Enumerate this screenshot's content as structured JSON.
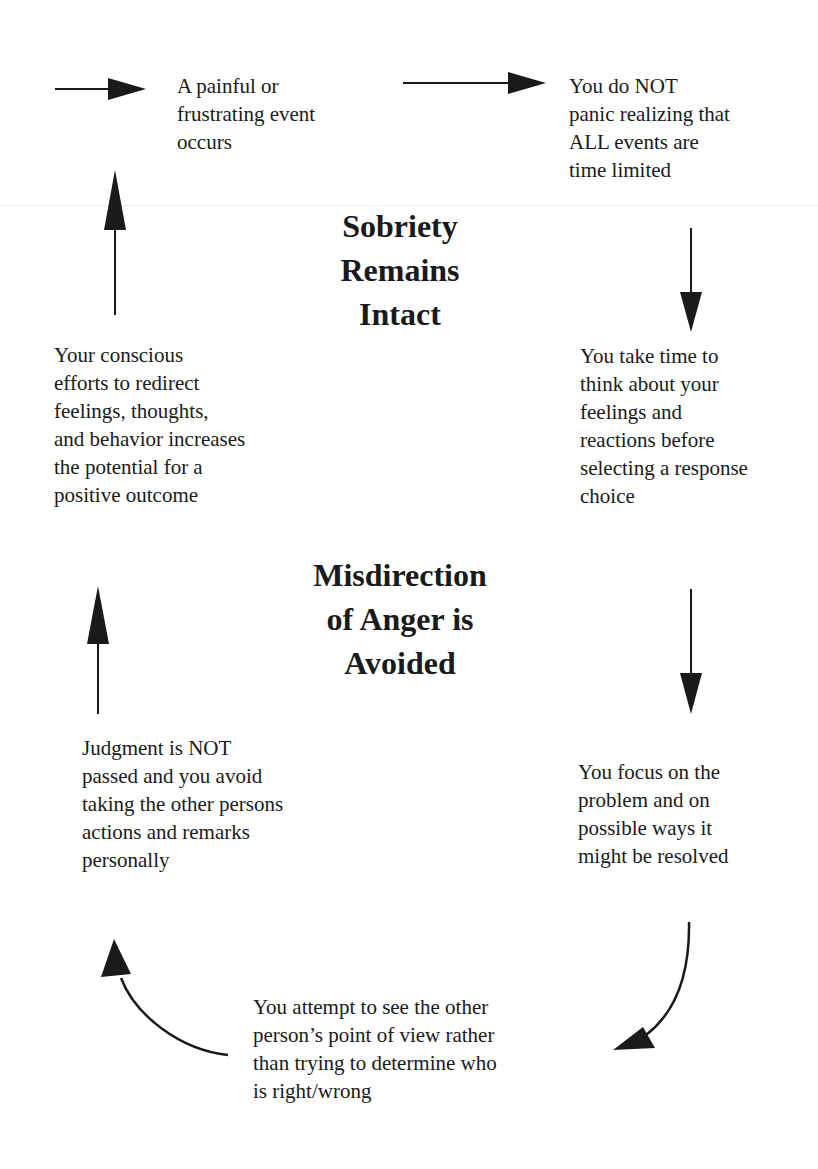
{
  "diagram": {
    "type": "cycle",
    "center_labels": {
      "top": "Sobriety\nRemains\nIntact",
      "bottom": "Misdirection\nof Anger is\nAvoided"
    },
    "nodes": [
      {
        "id": "n1",
        "text": "A painful or\nfrustrating event\noccurs"
      },
      {
        "id": "n2",
        "text": "You do NOT\npanic realizing that\nALL events are\ntime limited"
      },
      {
        "id": "n3",
        "text": "You take time to\nthink about your\nfeelings and\nreactions before\nselecting a response\nchoice"
      },
      {
        "id": "n4",
        "text": "You focus on the\nproblem and on\npossible ways it\nmight be resolved"
      },
      {
        "id": "n5",
        "text": "You attempt to see the other\nperson’s point of view rather\nthan trying to determine who\nis right/wrong"
      },
      {
        "id": "n6",
        "text": "Judgment is NOT\npassed and you avoid\ntaking the other persons\nactions and remarks\npersonally"
      },
      {
        "id": "n7",
        "text": "Your conscious\nefforts to redirect\nfeelings, thoughts,\nand behavior increases\nthe potential for a\npositive outcome"
      }
    ],
    "edges": [
      {
        "from": "start",
        "to": "n1",
        "direction": "right"
      },
      {
        "from": "n1",
        "to": "n2",
        "direction": "right"
      },
      {
        "from": "n2",
        "to": "n3",
        "direction": "down"
      },
      {
        "from": "n3",
        "to": "n4",
        "direction": "down"
      },
      {
        "from": "n4",
        "to": "n5",
        "direction": "curve-down-left"
      },
      {
        "from": "n5",
        "to": "n6",
        "direction": "curve-up-left"
      },
      {
        "from": "n6",
        "to": "n7",
        "direction": "up"
      },
      {
        "from": "n7",
        "to": "n1",
        "direction": "up"
      }
    ],
    "colors": {
      "ink": "#1a1a1a",
      "background": "#ffffff"
    }
  }
}
